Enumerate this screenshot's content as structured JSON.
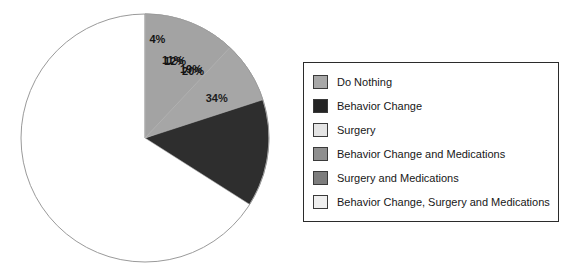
{
  "chart_data": {
    "type": "pie",
    "title": "",
    "subtitle": "",
    "xlabel": "",
    "ylabel": "",
    "grid": false,
    "legend_position": "right",
    "start_angle_deg": 0,
    "direction": "clockwise",
    "categories": [
      "Do Nothing",
      "Behavior Change",
      "Surgery",
      "Behavior Change and Medications",
      "Surgery and Medications",
      "Behavior Change, Surgery and Medications"
    ],
    "values": [
      12,
      34,
      19,
      20,
      11,
      4
    ],
    "labels": [
      "12%",
      "34%",
      "19%",
      "20%",
      "11%",
      "4%"
    ],
    "colors": [
      "#a8a8a8",
      "#2b2b2b",
      "#e8e8e8",
      "#9d9d9d",
      "#8e8e8e",
      "#f2f2f2"
    ],
    "slices_clockwise_from_top": [
      {
        "label": "4%",
        "value": 4,
        "category": "Behavior Change, Surgery and Medications",
        "color": "#e2e2e2"
      },
      {
        "label": "34%",
        "value": 34,
        "category": "Behavior Change",
        "color": "#2e2e2e"
      },
      {
        "label": "19%",
        "value": 19,
        "category": "Surgery",
        "color": "#ededed"
      },
      {
        "label": "20%",
        "value": 20,
        "category": "Behavior Change and Medications",
        "color": "#a6a6a6"
      },
      {
        "label": "11%",
        "value": 11,
        "category": "Surgery and Medications",
        "color": "#f4f4f4"
      },
      {
        "label": "12%",
        "value": 12,
        "category": "Do Nothing",
        "color": "#a3a3a3"
      }
    ]
  },
  "legend": {
    "items": [
      {
        "label": "Do Nothing",
        "color": "#a8a8a8"
      },
      {
        "label": "Behavior Change",
        "color": "#242424"
      },
      {
        "label": "Surgery",
        "color": "#e4e4e4"
      },
      {
        "label": "Behavior Change and Medications",
        "color": "#8f8f8f"
      },
      {
        "label": "Surgery and Medications",
        "color": "#7d7d7d"
      },
      {
        "label": "Behavior Change, Surgery and Medications",
        "color": "#efefef"
      }
    ]
  },
  "pie_geometry": {
    "center_x": 145,
    "center_y": 138,
    "radius": 124
  }
}
